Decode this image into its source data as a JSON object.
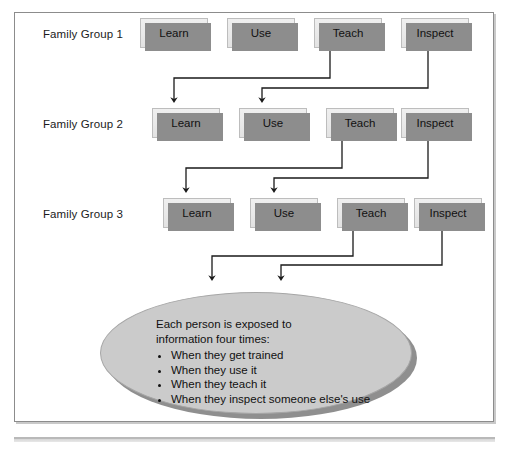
{
  "diagram": {
    "title_hidden": "",
    "rows": [
      {
        "label": "Family Group 1",
        "boxes": [
          {
            "label": "Learn"
          },
          {
            "label": "Use"
          },
          {
            "label": "Teach"
          },
          {
            "label": "Inspect"
          }
        ]
      },
      {
        "label": "Family Group 2",
        "boxes": [
          {
            "label": "Learn"
          },
          {
            "label": "Use"
          },
          {
            "label": "Teach"
          },
          {
            "label": "Inspect"
          }
        ]
      },
      {
        "label": "Family Group 3",
        "boxes": [
          {
            "label": "Learn"
          },
          {
            "label": "Use"
          },
          {
            "label": "Teach"
          },
          {
            "label": "Inspect"
          }
        ]
      }
    ],
    "callout": {
      "lead_line_1": "Each person is exposed to",
      "lead_line_2": "information four times:",
      "bullets": [
        "When they get trained",
        "When they use it",
        "When they teach it",
        "When they inspect someone else's use"
      ]
    },
    "colors": {
      "box_fill": "#e9e9e9",
      "box_border": "#bdbdbd",
      "box_shadow": "#8d8d8d",
      "ellipse_fill": "#cbcbcb",
      "ellipse_border": "#a6a6a6",
      "ellipse_shadow": "#8f8f8f",
      "connector": "#1a1a1a",
      "frame_border": "#8c8c8c",
      "rule": "#b9b9b9",
      "text": "#111111",
      "page_background": "#ffffff"
    }
  }
}
